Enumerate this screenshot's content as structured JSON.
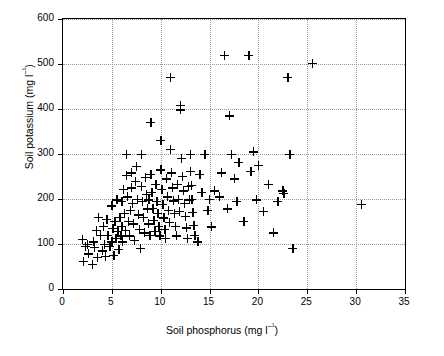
{
  "chart_data": {
    "type": "scatter",
    "title": "",
    "xlabel": "Soil phosphorus (mg l⁻¹)",
    "ylabel": "Soil potassium (mg l⁻¹)",
    "xlim": [
      0,
      35
    ],
    "ylim": [
      0,
      600
    ],
    "xticks": [
      0,
      5,
      10,
      15,
      20,
      25,
      30,
      35
    ],
    "xticklabels": [
      "0",
      "5",
      "10",
      "15",
      "20",
      "25",
      "30",
      "35"
    ],
    "yticks": [
      0,
      100,
      200,
      300,
      400,
      500,
      600
    ],
    "yticklabels": [
      "0",
      "100",
      "200",
      "300",
      "400",
      "500",
      "600"
    ],
    "grid": "dotted horizontal and vertical at major ticks",
    "legend": "none",
    "marker": "plus",
    "marker_color": "#000000",
    "points": [
      [
        2.0,
        110
      ],
      [
        2.1,
        62
      ],
      [
        2.3,
        95
      ],
      [
        2.5,
        100
      ],
      [
        2.6,
        78
      ],
      [
        3.0,
        55
      ],
      [
        3.1,
        105
      ],
      [
        3.2,
        92
      ],
      [
        3.4,
        130
      ],
      [
        3.5,
        70
      ],
      [
        3.6,
        160
      ],
      [
        3.8,
        120
      ],
      [
        4.0,
        85
      ],
      [
        4.1,
        140
      ],
      [
        4.2,
        100
      ],
      [
        4.3,
        72
      ],
      [
        4.5,
        155
      ],
      [
        4.6,
        120
      ],
      [
        4.8,
        95
      ],
      [
        5.0,
        105
      ],
      [
        5.0,
        185
      ],
      [
        5.1,
        135
      ],
      [
        5.2,
        75
      ],
      [
        5.3,
        150
      ],
      [
        5.4,
        112
      ],
      [
        5.5,
        198
      ],
      [
        5.6,
        128
      ],
      [
        5.7,
        88
      ],
      [
        5.8,
        160
      ],
      [
        5.9,
        118
      ],
      [
        6.0,
        195
      ],
      [
        6.0,
        140
      ],
      [
        6.1,
        105
      ],
      [
        6.2,
        222
      ],
      [
        6.3,
        168
      ],
      [
        6.4,
        130
      ],
      [
        6.5,
        300
      ],
      [
        6.5,
        252
      ],
      [
        6.6,
        205
      ],
      [
        6.7,
        150
      ],
      [
        6.8,
        118
      ],
      [
        6.9,
        175
      ],
      [
        7.0,
        258
      ],
      [
        7.0,
        225
      ],
      [
        7.1,
        190
      ],
      [
        7.2,
        145
      ],
      [
        7.3,
        108
      ],
      [
        7.4,
        240
      ],
      [
        7.5,
        272
      ],
      [
        7.6,
        200
      ],
      [
        7.7,
        165
      ],
      [
        7.8,
        132
      ],
      [
        7.9,
        90
      ],
      [
        8.0,
        300
      ],
      [
        8.0,
        228
      ],
      [
        8.1,
        195
      ],
      [
        8.2,
        160
      ],
      [
        8.3,
        125
      ],
      [
        8.4,
        248
      ],
      [
        8.5,
        210
      ],
      [
        8.6,
        178
      ],
      [
        8.7,
        145
      ],
      [
        8.8,
        198
      ],
      [
        8.9,
        120
      ],
      [
        9.0,
        370
      ],
      [
        9.0,
        255
      ],
      [
        9.1,
        215
      ],
      [
        9.2,
        180
      ],
      [
        9.3,
        152
      ],
      [
        9.4,
        128
      ],
      [
        9.5,
        232
      ],
      [
        9.6,
        195
      ],
      [
        9.7,
        168
      ],
      [
        9.8,
        140
      ],
      [
        9.9,
        118
      ],
      [
        10.0,
        330
      ],
      [
        10.0,
        265
      ],
      [
        10.1,
        222
      ],
      [
        10.2,
        188
      ],
      [
        10.3,
        158
      ],
      [
        10.4,
        132
      ],
      [
        10.5,
        112
      ],
      [
        10.6,
        245
      ],
      [
        10.7,
        205
      ],
      [
        10.8,
        175
      ],
      [
        10.9,
        148
      ],
      [
        11.0,
        470
      ],
      [
        11.0,
        310
      ],
      [
        11.1,
        258
      ],
      [
        11.2,
        225
      ],
      [
        11.3,
        196
      ],
      [
        11.4,
        168
      ],
      [
        11.5,
        140
      ],
      [
        11.6,
        118
      ],
      [
        11.7,
        232
      ],
      [
        11.8,
        200
      ],
      [
        11.9,
        172
      ],
      [
        12.0,
        408
      ],
      [
        12.0,
        398
      ],
      [
        12.1,
        290
      ],
      [
        12.2,
        250
      ],
      [
        12.3,
        218
      ],
      [
        12.4,
        190
      ],
      [
        12.5,
        162
      ],
      [
        12.6,
        136
      ],
      [
        12.7,
        112
      ],
      [
        12.8,
        228
      ],
      [
        12.9,
        198
      ],
      [
        13.0,
        300
      ],
      [
        13.0,
        262
      ],
      [
        13.1,
        230
      ],
      [
        13.2,
        200
      ],
      [
        13.3,
        170
      ],
      [
        13.4,
        142
      ],
      [
        13.5,
        120
      ],
      [
        13.8,
        105
      ],
      [
        14.0,
        255
      ],
      [
        14.2,
        215
      ],
      [
        14.5,
        300
      ],
      [
        14.8,
        175
      ],
      [
        15.0,
        200
      ],
      [
        15.2,
        138
      ],
      [
        15.5,
        218
      ],
      [
        16.0,
        205
      ],
      [
        16.2,
        258
      ],
      [
        16.5,
        520
      ],
      [
        16.8,
        178
      ],
      [
        17.0,
        385
      ],
      [
        17.2,
        300
      ],
      [
        17.5,
        245
      ],
      [
        17.8,
        195
      ],
      [
        18.0,
        282
      ],
      [
        18.5,
        150
      ],
      [
        19.0,
        520
      ],
      [
        19.2,
        262
      ],
      [
        19.5,
        305
      ],
      [
        19.8,
        198
      ],
      [
        20.0,
        275
      ],
      [
        20.5,
        172
      ],
      [
        21.0,
        232
      ],
      [
        21.5,
        125
      ],
      [
        22.0,
        195
      ],
      [
        22.5,
        218
      ],
      [
        22.6,
        212
      ],
      [
        23.0,
        470
      ],
      [
        23.2,
        300
      ],
      [
        23.5,
        90
      ],
      [
        25.5,
        502
      ],
      [
        30.5,
        188
      ]
    ]
  }
}
